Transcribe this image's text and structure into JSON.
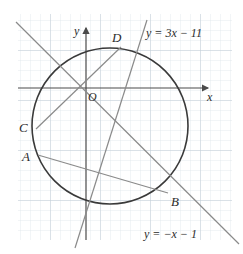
{
  "figure": {
    "background_color": "#ffffff",
    "grid": {
      "minor_color": "#dfe6ec",
      "major_color": "#c3ced8",
      "spacing_px": 10,
      "major_every": 5,
      "visible": true,
      "paper_left": 18,
      "paper_top": 14,
      "paper_right": 232,
      "paper_bottom": 240
    },
    "axes": {
      "color": "#4a4a4a",
      "origin_label": "O",
      "x_axis_label": "x",
      "y_axis_label": "y",
      "origin_px": {
        "x": 86,
        "y": 88
      },
      "x_axis_from": {
        "x": 18,
        "y": 88
      },
      "x_axis_to": {
        "x": 210,
        "y": 88
      },
      "y_axis_from": {
        "x": 86,
        "y": 240
      },
      "y_axis_to": {
        "x": 86,
        "y": 26
      },
      "arrows": true
    },
    "circle": {
      "center_px": {
        "x": 110,
        "y": 126
      },
      "radius_px": 78,
      "stroke_color": "#3a3a3a",
      "stroke_width": 1.6,
      "fill": "none"
    },
    "chords": [
      {
        "name": "chord-AB",
        "from_label": "A",
        "to_label": "B",
        "from_px": {
          "x": 38,
          "y": 155
        },
        "to_px": {
          "x": 168,
          "y": 193
        },
        "color": "#8a8a8a"
      },
      {
        "name": "chord-CD",
        "from_label": "C",
        "to_label": "D",
        "from_px": {
          "x": 36,
          "y": 129
        },
        "to_px": {
          "x": 121,
          "y": 47
        },
        "color": "#8a8a8a"
      }
    ],
    "lines": [
      {
        "name": "line-steep",
        "equation": "y = 3x − 11",
        "label_px": {
          "x": 148,
          "y": 36
        },
        "from_px": {
          "x": 75,
          "y": 246
        },
        "to_px": {
          "x": 147,
          "y": 22
        },
        "color": "#8a8a8a"
      },
      {
        "name": "line-diagonal",
        "equation": "y = −x − 1",
        "label_px": {
          "x": 146,
          "y": 236
        },
        "from_px": {
          "x": 16,
          "y": 22
        },
        "to_px": {
          "x": 238,
          "y": 243
        },
        "color": "#8a8a8a"
      }
    ],
    "point_labels": [
      {
        "text": "A",
        "x": 25,
        "y": 160,
        "name": "point-label-a"
      },
      {
        "text": "B",
        "x": 172,
        "y": 205,
        "name": "point-label-b"
      },
      {
        "text": "C",
        "x": 22,
        "y": 131,
        "name": "point-label-c"
      },
      {
        "text": "D",
        "x": 113,
        "y": 42,
        "name": "point-label-d"
      }
    ]
  }
}
